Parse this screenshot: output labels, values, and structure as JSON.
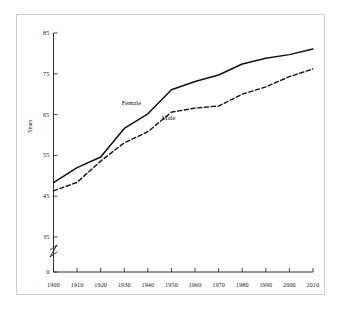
{
  "chart_data": {
    "type": "line",
    "title": "",
    "subtitle": "",
    "xlabel": "",
    "ylabel": "Years",
    "x": [
      1900,
      1910,
      1920,
      1930,
      1940,
      1950,
      1960,
      1970,
      1980,
      1990,
      2000,
      2010
    ],
    "xticklabels": [
      "1900",
      "1910",
      "1920",
      "1930",
      "1940",
      "1950",
      "1960",
      "1970",
      "1980",
      "1990",
      "2000",
      "2010"
    ],
    "yticklabels": [
      "0",
      "35",
      "45",
      "55",
      "65",
      "75",
      "85"
    ],
    "ytickvalues": [
      0,
      35,
      45,
      55,
      65,
      75,
      85
    ],
    "ylim": [
      0,
      85
    ],
    "xlim": [
      1900,
      2010
    ],
    "axis_break": true,
    "axis_break_note": "y-axis broken between 0 and 35",
    "grid": false,
    "legend": "inline-annotations",
    "series": [
      {
        "name": "Female",
        "style": "solid",
        "color": "#111111",
        "label_text": "Female",
        "values": [
          48.3,
          52.0,
          54.6,
          61.6,
          65.2,
          71.1,
          73.1,
          74.7,
          77.4,
          78.8,
          79.7,
          81.1
        ]
      },
      {
        "name": "Male",
        "style": "dashed",
        "color": "#111111",
        "label_text": "Male",
        "values": [
          46.3,
          48.4,
          53.6,
          58.1,
          60.8,
          65.6,
          66.6,
          67.1,
          70.0,
          71.8,
          74.3,
          76.2
        ]
      }
    ],
    "annotations": [
      {
        "text": "Female",
        "x": 1934,
        "y": 67.5
      },
      {
        "text": "Male",
        "x": 1951,
        "y": 64.0
      }
    ]
  }
}
